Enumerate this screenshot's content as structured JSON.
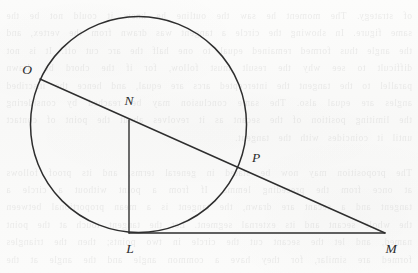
{
  "figure": {
    "kind": "geometry-diagram",
    "width": 418,
    "height": 273,
    "stroke_color": "#2e2e2e",
    "background_color": "#fbfbfa",
    "circle": {
      "name": "main-circle",
      "cx": 138.5,
      "cy": 124.5,
      "r": 108,
      "stroke_width": 1.5
    },
    "points": [
      {
        "id": "O",
        "label": "O",
        "x": 40,
        "y": 79,
        "label_x": 27,
        "label_y": 70
      },
      {
        "id": "N",
        "label": "N",
        "x": 129,
        "y": 120,
        "label_x": 129,
        "label_y": 101
      },
      {
        "id": "P",
        "label": "P",
        "x": 238,
        "y": 167,
        "label_x": 256,
        "label_y": 158
      },
      {
        "id": "L",
        "label": "L",
        "x": 129,
        "y": 233,
        "label_x": 130,
        "label_y": 249
      },
      {
        "id": "M",
        "label": "M",
        "x": 385,
        "y": 233,
        "label_x": 391,
        "label_y": 249
      }
    ],
    "segments": [
      {
        "id": "OM",
        "name": "secant-line-OM",
        "x1": 40,
        "y1": 79,
        "x2": 385,
        "y2": 233,
        "stroke_width": 1.4
      },
      {
        "id": "LM",
        "name": "tangent-line-LM",
        "x1": 129,
        "y1": 233,
        "x2": 385,
        "y2": 233,
        "stroke_width": 1.4
      },
      {
        "id": "NL",
        "name": "segment-NL",
        "x1": 129,
        "y1": 120,
        "x2": 129,
        "y2": 233,
        "stroke_width": 1.4
      }
    ]
  },
  "bleed_through": {
    "text": "of strategy. The moment he saw the outline he knew it could not be the same figure. In showing the circle a tangent was drawn from the vertex, and the angle thus formed remained equal to one half the arc cut off. It is not difficult to see why the result must follow, for if the chord be drawn parallel to the tangent the intercepted arcs are equal, and hence the inscribed angles are equal also. The same conclusion may be reached by considering the limiting position of the secant as it revolves about the point of contact until it coincides with the tangent.\n\nThe proposition may now be stated in general terms, and its proof follows at once from the preceding lemma. If from a point without a circle a tangent and a secant are drawn, the tangent is a mean proportional between the whole secant and its external segment. Let the tangent touch at the point named, and let the secant cut the circle in two points; then the triangles formed are similar, for they have a common angle and the angle at the tangent equals the inscribed angle standing on the same arc. From the similarity the proportion follows, and therefore the square of the tangent equals the product of the whole secant and its external segment, which was to be proved."
  }
}
